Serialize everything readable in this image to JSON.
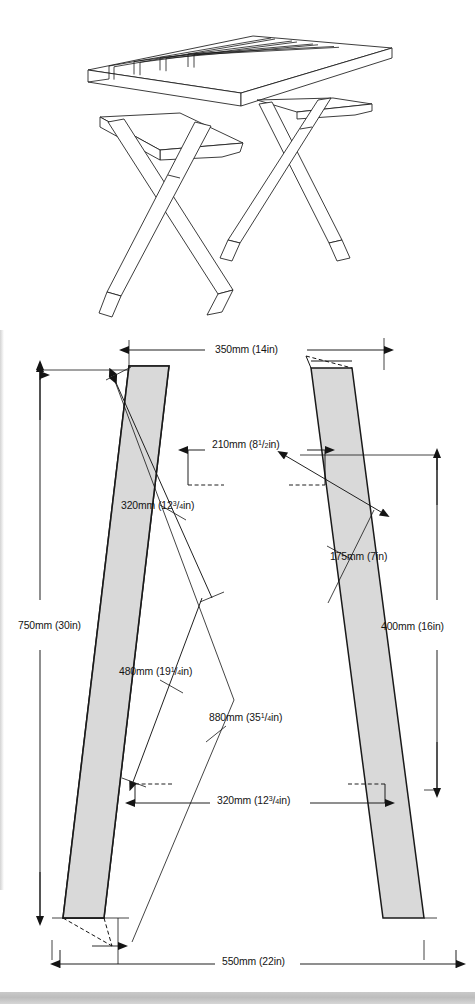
{
  "document": {
    "type": "woodworking-plan",
    "title": "Folding X-frame table — trestle leg assembly drawing",
    "units": "mm and inches",
    "background": "#ffffff",
    "line_color": "#141414",
    "timber_fill": "#d9d9d9"
  },
  "views": {
    "perspective": {
      "name": "perspective-view",
      "description": "Three-quarter perspective of a slatted-top table on two crossed X-frame leg assemblies",
      "top_slats": 6
    },
    "elevation": {
      "name": "leg-frame-elevation",
      "description": "Front elevation of the crossed X leg frame with dimension annotations"
    }
  },
  "dimensions": [
    {
      "id": "top-width",
      "name": "dimension-350mm",
      "mm": 350,
      "mm_text": "350mm",
      "in_text": "(14in)",
      "label": "350mm (14in)",
      "whole": "14",
      "frac_num": "",
      "frac_den": "",
      "orientation": "horizontal",
      "position": "top"
    },
    {
      "id": "inner-top-width",
      "name": "dimension-210mm",
      "mm": 210,
      "mm_text": "210mm",
      "in_text": "(8¹/₂in)",
      "label": "210mm (8¹⁄₂in)",
      "whole": "8",
      "frac_num": "1",
      "frac_den": "2",
      "orientation": "horizontal",
      "position": "upper-middle"
    },
    {
      "id": "left-upper-leg",
      "name": "dimension-320mm-upper",
      "mm": 320,
      "mm_text": "320mm",
      "in_text": "(12³/₄in)",
      "label": "320mm (12³⁄4in)",
      "whole": "12",
      "frac_num": "3",
      "frac_den": "4",
      "orientation": "diagonal",
      "position": "left-upper"
    },
    {
      "id": "right-upper-leg",
      "name": "dimension-175mm",
      "mm": 175,
      "mm_text": "175mm",
      "in_text": "(7in)",
      "label": "175mm (7in)",
      "whole": "7",
      "frac_num": "",
      "frac_den": "",
      "orientation": "diagonal",
      "position": "right-middle"
    },
    {
      "id": "overall-height",
      "name": "dimension-750mm",
      "mm": 750,
      "mm_text": "750mm",
      "in_text": "(30in)",
      "label": "750mm (30in)",
      "whole": "30",
      "frac_num": "",
      "frac_den": "",
      "orientation": "vertical",
      "position": "left"
    },
    {
      "id": "lower-height",
      "name": "dimension-400mm",
      "mm": 400,
      "mm_text": "400mm",
      "in_text": "(16in)",
      "label": "400mm (16in)",
      "whole": "16",
      "frac_num": "",
      "frac_den": "",
      "orientation": "vertical",
      "position": "right"
    },
    {
      "id": "left-lower-leg",
      "name": "dimension-480mm",
      "mm": 480,
      "mm_text": "480mm",
      "in_text": "(19¹/₄in)",
      "label": "480mm (19¹⁄4in)",
      "whole": "19",
      "frac_num": "1",
      "frac_den": "4",
      "orientation": "diagonal",
      "position": "left-lower"
    },
    {
      "id": "full-leg-length",
      "name": "dimension-880mm",
      "mm": 880,
      "mm_text": "880mm",
      "in_text": "(35¹/₄in)",
      "label": "880mm (35¹⁄4in)",
      "whole": "35",
      "frac_num": "1",
      "frac_den": "4",
      "orientation": "diagonal",
      "position": "centre"
    },
    {
      "id": "inner-foot-width",
      "name": "dimension-320mm-lower",
      "mm": 320,
      "mm_text": "320mm",
      "in_text": "(12³/₄in)",
      "label": "320mm (12³⁄4in)",
      "whole": "12",
      "frac_num": "3",
      "frac_den": "4",
      "orientation": "horizontal",
      "position": "lower-middle"
    },
    {
      "id": "overall-spread",
      "name": "dimension-550mm",
      "mm": 550,
      "mm_text": "550mm",
      "in_text": "(22in)",
      "label": "550mm (22in)",
      "whole": "22",
      "frac_num": "",
      "frac_den": "",
      "orientation": "horizontal",
      "position": "bottom"
    }
  ]
}
